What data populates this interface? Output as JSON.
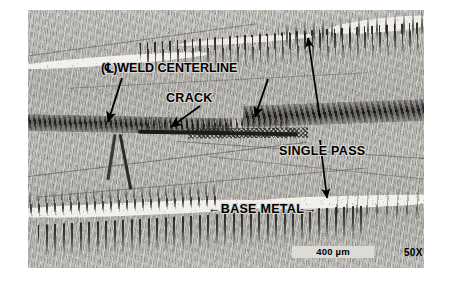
{
  "figure": {
    "type": "photomicrograph",
    "magnification": "50X",
    "scale_bar": {
      "length_label": "400 µm"
    }
  },
  "annotations": {
    "centerline": {
      "symbol": "℄",
      "prefix": "(",
      "suffix": ")",
      "label": "WELD CENTERLINE",
      "full_text": "(℄)WELD CENTERLINE",
      "leader_count": 2
    },
    "crack": {
      "label": "CRACK",
      "leader_count": 1
    },
    "single_pass": {
      "label": "SINGLE PASS",
      "leader_count": 1,
      "arrow_style": "double-headed-vertical"
    },
    "base_metal": {
      "label": "BASE METAL",
      "left_arrow": "←",
      "right_arrow": "→",
      "full_text": "←BASE METAL→"
    }
  },
  "colors": {
    "ink": "#000000",
    "plate_light_band": "#f2f0eb",
    "plate_matrix": "#b9b7b2",
    "plate_dark_dendrite": "#2c2b29",
    "page_background": "#ffffff"
  }
}
